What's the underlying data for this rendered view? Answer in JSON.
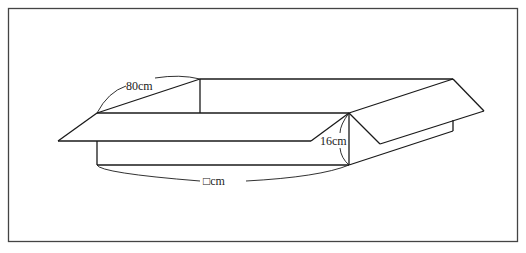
{
  "figure": {
    "type": "open-box-diagram",
    "labels": {
      "diagonal": "80cm",
      "height": "16cm",
      "length": "□cm"
    },
    "colors": {
      "stroke": "#1a1a1a",
      "frame": "#444444",
      "background": "#ffffff"
    }
  }
}
